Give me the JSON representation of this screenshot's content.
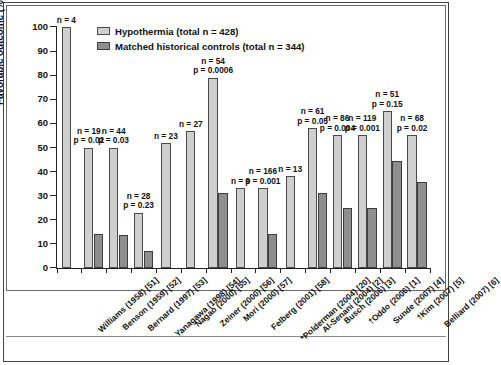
{
  "chart_data": {
    "type": "bar",
    "title": "",
    "xlabel": "",
    "ylabel": "Favorable outcome (%)",
    "ylim": [
      0,
      100
    ],
    "ytick_values": [
      0,
      10,
      20,
      30,
      40,
      50,
      60,
      70,
      80,
      90,
      100
    ],
    "ytick_labels": [
      "0",
      "10",
      "20",
      "30",
      "40",
      "50",
      "60",
      "70",
      "80",
      "90",
      "100"
    ],
    "grid": false,
    "legend_position": "top-center",
    "legend": [
      {
        "key": "hypothermia",
        "label": "Hypothermia (total n = 428)",
        "color": "#cfcfcf"
      },
      {
        "key": "controls",
        "label": "Matched historical controls (total n = 344)",
        "color": "#8e8e8e"
      }
    ],
    "categories": [
      "Williams (1958) [51]",
      "Benson (1959) [52]",
      "Bernard (1997) [53]",
      "Yanagawa (1998) [54]",
      "Nagao (2000) [55]",
      "Zeiner (2000) [56]",
      "Mori (2000) [57]",
      "Felberg (2001) [58]",
      "*Polderman (2004) [20]",
      "Al-Senani (2004) [2]",
      "Busch (2006) [3]",
      "†Oddo (2006) [1]",
      "Sunde (2007) [4]",
      "†Kim (2007) [5]",
      "Belliard (2007) [6]"
    ],
    "series": [
      {
        "name": "Hypothermia (total n = 428)",
        "color": "#cfcfcf",
        "values": [
          100,
          50,
          50,
          23,
          52,
          57,
          79,
          33,
          33,
          38,
          58,
          55,
          55,
          65,
          55
        ]
      },
      {
        "name": "Matched historical controls (total n = 344)",
        "color": "#8e8e8e",
        "values": [
          null,
          14,
          13.5,
          7,
          null,
          null,
          31,
          null,
          14,
          null,
          31,
          25,
          25,
          44.5,
          35.5
        ]
      }
    ],
    "annotations": [
      {
        "category": "Williams (1958) [51]",
        "n": "n = 4",
        "p": ""
      },
      {
        "category": "Benson (1959) [52]",
        "n": "n = 19",
        "p": "p = 0.02"
      },
      {
        "category": "Bernard (1997) [53]",
        "n": "n = 44",
        "p": "p = 0.03"
      },
      {
        "category": "Yanagawa (1998) [54]",
        "n": "n = 28",
        "p": "p = 0.23"
      },
      {
        "category": "Nagao (2000) [55]",
        "n": "n = 23",
        "p": ""
      },
      {
        "category": "Zeiner (2000) [56]",
        "n": "n = 27",
        "p": ""
      },
      {
        "category": "Mori (2000) [57]",
        "n": "n = 54",
        "p": "p = 0.0006"
      },
      {
        "category": "Felberg (2001) [58]",
        "n": "n = 9",
        "p": ""
      },
      {
        "category": "*Polderman (2004) [20]",
        "n": "n = 166",
        "p": "p = 0.001"
      },
      {
        "category": "Al-Senani (2004) [2]",
        "n": "n = 13",
        "p": ""
      },
      {
        "category": "Busch (2006) [3]",
        "n": "n = 61",
        "p": "p = 0.05"
      },
      {
        "category": "†Oddo (2006) [1]",
        "n": "n = 86",
        "p": "p = 0.004"
      },
      {
        "category": "Sunde (2007) [4]",
        "n": "n = 119",
        "p": "p = 0.001"
      },
      {
        "category": "†Kim (2007) [5]",
        "n": "n = 51",
        "p": "p = 0.15"
      },
      {
        "category": "Belliard (2007) [6]",
        "n": "n = 68",
        "p": "p = 0.02"
      }
    ]
  }
}
